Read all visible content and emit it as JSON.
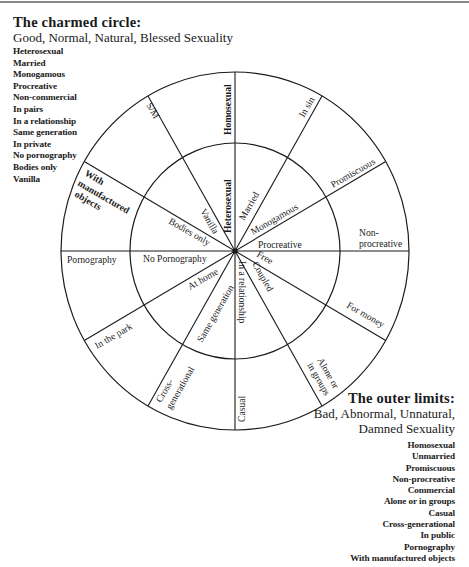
{
  "charmed_circle": {
    "title": "The charmed circle:",
    "subtitle": "Good, Normal, Natural, Blessed Sexuality",
    "items": [
      "Heterosexual",
      "Married",
      "Monogamous",
      "Procreative",
      "Non-commercial",
      "In pairs",
      "In a relationship",
      "Same generation",
      "In private",
      "No pornography",
      "Bodies only",
      "Vanilla"
    ]
  },
  "outer_limits": {
    "title": "The outer limits:",
    "subtitle_line1": "Bad, Abnormal, Unnatural,",
    "subtitle_line2": "Damned Sexuality",
    "items": [
      "Homosexual",
      "Unmarried",
      "Promiscuous",
      "Non-procreative",
      "Commercial",
      "Alone or in groups",
      "Casual",
      "Cross-generational",
      "In public",
      "Pornography",
      "With manufactured objects"
    ]
  },
  "diagram": {
    "inner_labels": {
      "heterosexual": "Heterosexual",
      "married": "Married",
      "monogamous": "Monogamous",
      "procreative": "Procreative",
      "free": "Free",
      "coupled": "Coupled",
      "in_a_relationship": "In a relationship",
      "same_generation": "Same generation",
      "at_home": "At home",
      "no_pornography": "No Pornography",
      "bodies_only": "Bodies only",
      "vanilla": "Vanilla"
    },
    "outer_labels": {
      "homosexual": "Homosexual",
      "in_sin": "In sin",
      "promiscuous": "Promiscuous",
      "non_procreative_1": "Non-",
      "non_procreative_2": "procreative",
      "for_money": "For money",
      "alone_1": "Alone or",
      "alone_2": "in groups",
      "casual": "Casual",
      "cross_gen_1": "Cross-",
      "cross_gen_2": "generational",
      "in_the_park": "In the park",
      "pornography": "Pornography",
      "with_manuf_1": "With",
      "with_manuf_2": "manufactured",
      "with_manuf_3": "objects",
      "s_m": "S/M"
    }
  }
}
